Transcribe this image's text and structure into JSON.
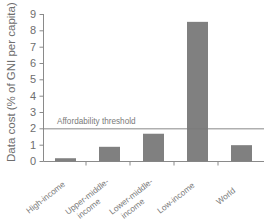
{
  "chart_data": {
    "type": "bar",
    "title": "",
    "xlabel": "",
    "ylabel": "Data cost (% of GNI per capita)",
    "ylim": [
      0,
      9
    ],
    "yticks": [
      "0",
      "1",
      "2",
      "3",
      "4",
      "5",
      "6",
      "7",
      "8",
      "9"
    ],
    "grid": false,
    "legend": "none",
    "categories": [
      "High-income",
      "Upper-middle-income",
      "Lower-middle-income",
      "Low-income",
      "World"
    ],
    "category_lines": [
      [
        "High-income"
      ],
      [
        "Upper-middle-",
        "income"
      ],
      [
        "Lower-middle-",
        "income"
      ],
      [
        "Low-income"
      ],
      [
        "World"
      ]
    ],
    "values": [
      0.2,
      0.9,
      1.7,
      8.55,
      1.0
    ],
    "bar_color": "#808080",
    "annotations": [
      {
        "label": "Affordability threshold",
        "value": 2,
        "type": "hline",
        "color": "#7a7a7a"
      }
    ]
  },
  "axis": {
    "line_color": "#8a8a8a",
    "text_color": "#6e6e6e"
  }
}
